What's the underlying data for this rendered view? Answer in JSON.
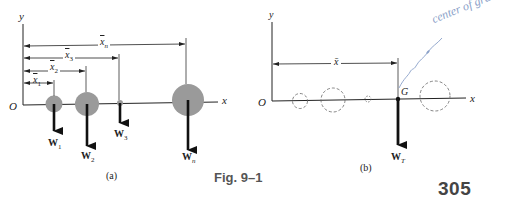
{
  "figure": {
    "caption": "Fig. 9–1",
    "page_number": "305"
  },
  "panel_a": {
    "label": "(a)",
    "axis_x": "x",
    "axis_y": "y",
    "origin": "O",
    "distances": [
      "x̃₁",
      "x̃₂",
      "x̃₃",
      "x̃ₙ"
    ],
    "distance_labels": [
      {
        "base": "x",
        "sub": "1"
      },
      {
        "base": "x",
        "sub": "2"
      },
      {
        "base": "x",
        "sub": "3"
      },
      {
        "base": "x",
        "sub": "n"
      }
    ],
    "weights": [
      {
        "base": "W",
        "sub": "1"
      },
      {
        "base": "W",
        "sub": "2"
      },
      {
        "base": "W",
        "sub": "3"
      },
      {
        "base": "W",
        "sub": "n"
      }
    ],
    "particle_color": "#9a9a9a"
  },
  "panel_b": {
    "label": "(b)",
    "axis_x": "x",
    "axis_y": "y",
    "origin": "O",
    "distance_label": "x̄",
    "point_label": "G",
    "resultant_weight": {
      "base": "W",
      "sub": "T"
    },
    "handwritten_note": "center of gravity",
    "handwriting_color": "#8aa0c8"
  }
}
